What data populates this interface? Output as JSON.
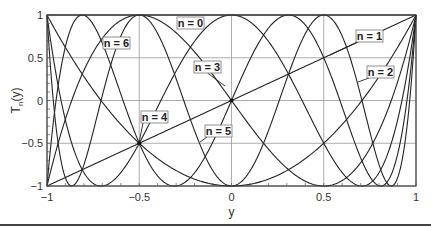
{
  "chart_data": {
    "type": "line",
    "title": "",
    "xlabel": "y",
    "ylabel": "T_n(y)",
    "xlim": [
      -1,
      1
    ],
    "ylim": [
      -1,
      1
    ],
    "x_ticks": [
      -1,
      -0.5,
      0,
      0.5,
      1
    ],
    "x_tick_labels": [
      "−1",
      "−0.5",
      "0",
      "0.5",
      "1"
    ],
    "y_ticks": [
      -1,
      -0.5,
      0,
      0.5,
      1
    ],
    "y_tick_labels": [
      "−1",
      "−0.5",
      "0",
      "0.5",
      "1"
    ],
    "grid": true,
    "legend": "inline labels",
    "function": "Chebyshev polynomials of the first kind, T_n(y) = cos(n arccos y)",
    "series": [
      {
        "name": "n = 0",
        "n": 0,
        "label_box": {
          "x": 177,
          "y": 17
        },
        "leader_to": null
      },
      {
        "name": "n = 1",
        "n": 1,
        "label_box": {
          "x": 356,
          "y": 30
        },
        "leader_to": {
          "x": 330,
          "y": 55
        }
      },
      {
        "name": "n = 2",
        "n": 2,
        "label_box": {
          "x": 367,
          "y": 66
        },
        "leader_to": {
          "x": 358,
          "y": 82
        }
      },
      {
        "name": "n = 3",
        "n": 3,
        "label_box": {
          "x": 194,
          "y": 61
        },
        "leader_to": {
          "x": 225,
          "y": 86
        }
      },
      {
        "name": "n = 4",
        "n": 4,
        "label_box": {
          "x": 141,
          "y": 111
        },
        "leader_to": {
          "x": 139,
          "y": 143
        }
      },
      {
        "name": "n = 5",
        "n": 5,
        "label_box": {
          "x": 205,
          "y": 125
        },
        "leader_to": {
          "x": 200,
          "y": 142
        }
      },
      {
        "name": "n = 6",
        "n": 6,
        "label_box": {
          "x": 103,
          "y": 37
        },
        "leader_to": null
      }
    ],
    "sample_points": {
      "x": [
        -1,
        -0.5,
        0,
        0.5,
        1
      ],
      "n0": [
        1,
        1,
        1,
        1,
        1
      ],
      "n1": [
        -1,
        -0.5,
        0,
        0.5,
        1
      ],
      "n2": [
        1,
        -0.5,
        -1,
        -0.5,
        1
      ],
      "n3": [
        -1,
        1,
        0,
        -1,
        1
      ],
      "n4": [
        1,
        -0.5,
        1,
        -0.5,
        1
      ],
      "n5": [
        -1,
        -0.5,
        0,
        0.5,
        1
      ],
      "n6": [
        1,
        1,
        -1,
        1,
        1
      ]
    }
  },
  "layout": {
    "plot_left": 47,
    "plot_right": 416,
    "plot_top": 15,
    "plot_bottom": 186
  }
}
